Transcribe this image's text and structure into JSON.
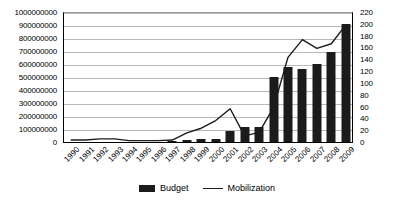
{
  "chart_data": {
    "type": "bar",
    "title": "",
    "xlabel": "",
    "ylabel": "",
    "categories": [
      "1990",
      "1991",
      "1992",
      "1993",
      "1994",
      "1995",
      "1996",
      "1997",
      "1998",
      "1999",
      "2000",
      "2001",
      "2002",
      "2003",
      "2004",
      "2005",
      "2006",
      "2007",
      "2008",
      "2009"
    ],
    "grid": true,
    "legend_position": "bottom",
    "axes": {
      "left": {
        "label": "",
        "min": 0,
        "max": 1000000000,
        "step": 100000000,
        "ticks": [
          "0",
          "100000000",
          "200000000",
          "300000000",
          "400000000",
          "500000000",
          "600000000",
          "700000000",
          "800000000",
          "900000000",
          "1000000000"
        ]
      },
      "right": {
        "label": "",
        "min": 0,
        "max": 220,
        "step": 20,
        "ticks": [
          "0",
          "20",
          "40",
          "60",
          "80",
          "100",
          "120",
          "140",
          "160",
          "180",
          "200",
          "220"
        ]
      }
    },
    "series": [
      {
        "name": "Budget",
        "type": "bar",
        "axis": "left",
        "color": "#1b1b1b",
        "values": [
          0,
          0,
          0,
          0,
          0,
          0,
          0,
          10000000,
          12000000,
          22000000,
          22000000,
          85000000,
          115000000,
          115000000,
          500000000,
          575000000,
          565000000,
          600000000,
          690000000,
          905000000
        ]
      },
      {
        "name": "Mobilization",
        "type": "line",
        "axis": "right",
        "color": "#1b1b1b",
        "values": [
          5,
          5,
          7,
          7,
          4,
          4,
          4,
          5,
          17,
          25,
          38,
          58,
          12,
          18,
          60,
          145,
          175,
          160,
          168,
          200
        ]
      }
    ]
  },
  "legend": {
    "items": [
      {
        "label": "Budget",
        "marker": "bar-swatch"
      },
      {
        "label": "Mobilization",
        "marker": "line-swatch"
      }
    ]
  }
}
